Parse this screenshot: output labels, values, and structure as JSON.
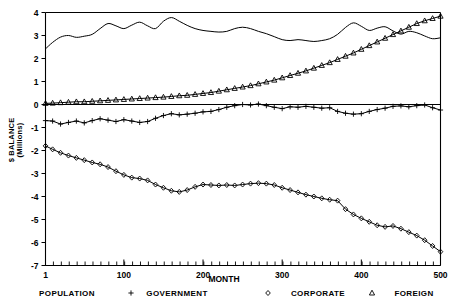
{
  "chart_data": {
    "type": "line",
    "title": "",
    "xlabel": "MONTH",
    "ylabel": "$ BALANCE (Millions)",
    "ylabel_line1": "$ BALANCE",
    "ylabel_line2": "(Millions)",
    "xlim": [
      1,
      500
    ],
    "ylim": [
      -7,
      4
    ],
    "xticks": [
      1,
      100,
      200,
      300,
      400,
      500
    ],
    "xtick_labels": [
      "1",
      "100",
      "200",
      "300",
      "400",
      "500"
    ],
    "yticks": [
      4,
      3,
      2,
      1,
      0,
      -1,
      -2,
      -3,
      -4,
      -5,
      -6,
      -7
    ],
    "ytick_labels": [
      "4",
      "3",
      "2",
      "1",
      "0",
      "-1",
      "-2",
      "-3",
      "-4",
      "-5",
      "-6",
      "-7"
    ],
    "grid": false,
    "legend_position": "below-axis",
    "legend": [
      {
        "label": "POPULATION",
        "marker": "none"
      },
      {
        "label": "GOVERNMENT",
        "marker": "plus"
      },
      {
        "label": "CORPORATE",
        "marker": "diamond"
      },
      {
        "label": "FOREIGN",
        "marker": "triangle"
      }
    ],
    "x": [
      1,
      10,
      20,
      30,
      40,
      50,
      60,
      70,
      80,
      90,
      100,
      110,
      120,
      130,
      140,
      150,
      160,
      170,
      180,
      190,
      200,
      210,
      220,
      230,
      240,
      250,
      260,
      270,
      280,
      290,
      300,
      310,
      320,
      330,
      340,
      350,
      360,
      370,
      380,
      390,
      400,
      410,
      420,
      430,
      440,
      450,
      460,
      470,
      480,
      490,
      500
    ],
    "series": [
      {
        "name": "POPULATION",
        "marker": "none",
        "values": [
          2.42,
          2.7,
          2.93,
          3.0,
          2.92,
          2.97,
          3.05,
          3.3,
          3.52,
          3.42,
          3.3,
          3.45,
          3.58,
          3.42,
          3.3,
          3.62,
          3.78,
          3.62,
          3.44,
          3.3,
          3.22,
          3.18,
          3.15,
          3.18,
          3.3,
          3.36,
          3.3,
          3.18,
          3.08,
          2.95,
          2.82,
          2.78,
          2.82,
          2.78,
          2.74,
          2.78,
          2.86,
          3.05,
          3.35,
          3.55,
          3.4,
          3.22,
          3.32,
          3.38,
          3.2,
          3.06,
          3.18,
          3.12,
          2.98,
          2.86,
          2.9
        ]
      },
      {
        "name": "GOVERNMENT",
        "marker": "plus",
        "values": [
          -0.7,
          -0.72,
          -0.85,
          -0.78,
          -0.72,
          -0.8,
          -0.7,
          -0.62,
          -0.68,
          -0.74,
          -0.66,
          -0.72,
          -0.78,
          -0.74,
          -0.6,
          -0.48,
          -0.4,
          -0.45,
          -0.42,
          -0.38,
          -0.32,
          -0.3,
          -0.22,
          -0.12,
          -0.05,
          0.0,
          -0.02,
          0.02,
          -0.05,
          -0.12,
          -0.18,
          -0.1,
          -0.12,
          -0.08,
          -0.12,
          -0.16,
          -0.14,
          -0.3,
          -0.38,
          -0.42,
          -0.4,
          -0.3,
          -0.22,
          -0.16,
          -0.08,
          -0.06,
          -0.1,
          -0.05,
          -0.02,
          -0.14,
          -0.24
        ]
      },
      {
        "name": "CORPORATE",
        "marker": "diamond",
        "values": [
          -1.8,
          -1.95,
          -2.1,
          -2.22,
          -2.32,
          -2.42,
          -2.52,
          -2.6,
          -2.72,
          -2.9,
          -3.06,
          -3.18,
          -3.22,
          -3.3,
          -3.48,
          -3.62,
          -3.75,
          -3.8,
          -3.72,
          -3.58,
          -3.48,
          -3.5,
          -3.52,
          -3.5,
          -3.52,
          -3.48,
          -3.44,
          -3.42,
          -3.44,
          -3.5,
          -3.62,
          -3.72,
          -3.82,
          -3.92,
          -4.0,
          -4.08,
          -4.14,
          -4.18,
          -4.55,
          -4.78,
          -4.95,
          -5.1,
          -5.25,
          -5.32,
          -5.28,
          -5.4,
          -5.55,
          -5.7,
          -5.9,
          -6.15,
          -6.4
        ]
      },
      {
        "name": "FOREIGN",
        "marker": "triangle",
        "values": [
          0.05,
          0.06,
          0.08,
          0.1,
          0.12,
          0.12,
          0.14,
          0.16,
          0.18,
          0.2,
          0.22,
          0.24,
          0.26,
          0.28,
          0.3,
          0.32,
          0.35,
          0.38,
          0.4,
          0.44,
          0.48,
          0.52,
          0.58,
          0.64,
          0.7,
          0.76,
          0.82,
          0.9,
          0.98,
          1.06,
          1.16,
          1.26,
          1.36,
          1.46,
          1.58,
          1.7,
          1.82,
          1.96,
          2.1,
          2.24,
          2.4,
          2.56,
          2.72,
          2.88,
          3.04,
          3.2,
          3.36,
          3.52,
          3.64,
          3.74,
          3.84
        ]
      }
    ]
  }
}
